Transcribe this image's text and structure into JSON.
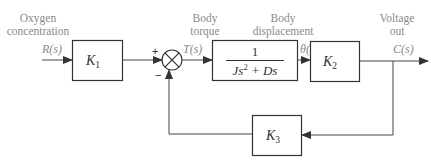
{
  "diagram": {
    "type": "block-diagram",
    "labels": {
      "input_desc_line1": "Oxygen",
      "input_desc_line2": "concentration",
      "torque_desc_line1": "Body",
      "torque_desc_line2": "torque",
      "disp_desc_line1": "Body",
      "disp_desc_line2": "displacement",
      "output_desc_line1": "Voltage",
      "output_desc_line2": "out"
    },
    "signals": {
      "input": "R(s)",
      "torque": "T(s)",
      "displacement": "θ(s)",
      "output": "C(s)"
    },
    "summing_junction": {
      "plus": "+",
      "minus": "−"
    },
    "blocks": {
      "k1": {
        "symbol": "K",
        "subscript": "1"
      },
      "plant": {
        "numerator": "1",
        "denominator_a": "Js",
        "denominator_exp": "2",
        "denominator_b": " + Ds"
      },
      "k2": {
        "symbol": "K",
        "subscript": "2"
      },
      "k3": {
        "symbol": "K",
        "subscript": "3"
      }
    },
    "colors": {
      "line": "#444444",
      "text": "#8a8a8a"
    }
  }
}
